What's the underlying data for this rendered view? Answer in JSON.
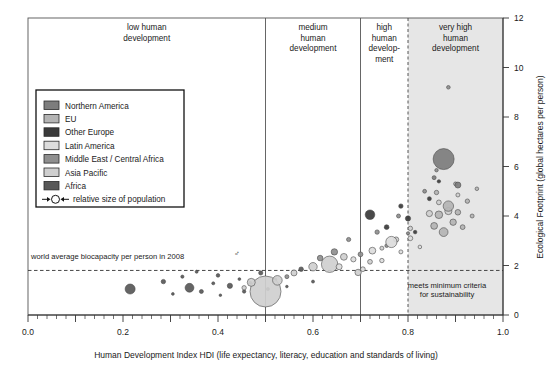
{
  "chart_data": {
    "type": "scatter",
    "title": "",
    "xlabel": "Human Development Index HDI (life expectancy, literacy, education and standards of living)",
    "ylabel": "Ecological Footprint (global hectares per person)",
    "xlim": [
      0.0,
      1.0
    ],
    "ylim": [
      0,
      12
    ],
    "xticks": [
      "0.0",
      "0.2",
      "0.4",
      "0.6",
      "0.8",
      "1.0"
    ],
    "xtick_values": [
      0.0,
      0.2,
      0.4,
      0.6,
      0.8,
      1.0
    ],
    "yticks": [
      "0",
      "2",
      "4",
      "6",
      "8",
      "10",
      "12"
    ],
    "ytick_values": [
      0,
      2,
      4,
      6,
      8,
      10,
      12
    ],
    "grid": false,
    "bubble_size_meaning": "relative size of population",
    "bands": [
      {
        "label": "low human development",
        "x_start": 0.0,
        "x_end": 0.5,
        "divider": "solid"
      },
      {
        "label": "medium human development",
        "x_start": 0.5,
        "x_end": 0.7,
        "divider": "solid"
      },
      {
        "label": "high human develop- ment",
        "x_start": 0.7,
        "x_end": 0.8,
        "divider": "solid"
      },
      {
        "label": "very high human development",
        "x_start": 0.8,
        "x_end": 1.0,
        "divider": "dashed",
        "shaded": true
      }
    ],
    "reference_lines": [
      {
        "label": "world average biocapacity per person in 2008",
        "orientation": "horizontal",
        "value": 1.8,
        "style": "dashed"
      },
      {
        "label": "meets minimum criteria for sustainability",
        "orientation": "vertical",
        "value": 0.8,
        "style": "dashed"
      }
    ],
    "annotations": [
      "world average biocapacity per person in 2008",
      "meets minimum criteria for sustainability"
    ],
    "legend": {
      "position": "upper-left inside plot",
      "entries": [
        {
          "name": "Northern America",
          "color": "#7d7d7d"
        },
        {
          "name": "EU",
          "color": "#b4b4b4"
        },
        {
          "name": "Other Europe",
          "color": "#3a3a3a"
        },
        {
          "name": "Latin America",
          "color": "#dcdcdc"
        },
        {
          "name": "Middle East / Central Africa",
          "color": "#8f8f8f"
        },
        {
          "name": "Asia Pacific",
          "color": "#cfcfcf"
        },
        {
          "name": "Africa",
          "color": "#585858"
        }
      ],
      "size_key_label": "relative size of population"
    },
    "series": [
      {
        "name": "Africa",
        "color": "#585858",
        "points": [
          {
            "x": 0.215,
            "y": 1.05,
            "r": 5.0
          },
          {
            "x": 0.285,
            "y": 1.35,
            "r": 2.2
          },
          {
            "x": 0.305,
            "y": 0.85,
            "r": 1.4
          },
          {
            "x": 0.325,
            "y": 1.55,
            "r": 1.6
          },
          {
            "x": 0.34,
            "y": 1.1,
            "r": 4.4
          },
          {
            "x": 0.355,
            "y": 1.75,
            "r": 1.5
          },
          {
            "x": 0.365,
            "y": 0.95,
            "r": 2.0
          },
          {
            "x": 0.39,
            "y": 1.28,
            "r": 1.5
          },
          {
            "x": 0.4,
            "y": 1.6,
            "r": 1.8
          },
          {
            "x": 0.405,
            "y": 0.8,
            "r": 1.3
          },
          {
            "x": 0.425,
            "y": 1.18,
            "r": 2.6
          },
          {
            "x": 0.445,
            "y": 1.45,
            "r": 1.4
          },
          {
            "x": 0.455,
            "y": 0.95,
            "r": 1.7
          },
          {
            "x": 0.468,
            "y": 1.3,
            "r": 1.5
          },
          {
            "x": 0.49,
            "y": 1.7,
            "r": 2.1
          },
          {
            "x": 0.505,
            "y": 1.05,
            "r": 1.6
          },
          {
            "x": 0.52,
            "y": 1.42,
            "r": 1.9
          },
          {
            "x": 0.545,
            "y": 1.15,
            "r": 1.3
          },
          {
            "x": 0.575,
            "y": 1.85,
            "r": 2.3
          },
          {
            "x": 0.6,
            "y": 1.35,
            "r": 1.5
          }
        ]
      },
      {
        "name": "Asia Pacific",
        "color": "#cfcfcf",
        "points": [
          {
            "x": 0.5,
            "y": 0.95,
            "r": 15.5
          },
          {
            "x": 0.47,
            "y": 1.32,
            "r": 4.0
          },
          {
            "x": 0.455,
            "y": 1.1,
            "r": 2.2
          },
          {
            "x": 0.525,
            "y": 1.4,
            "r": 4.8
          },
          {
            "x": 0.56,
            "y": 1.7,
            "r": 3.0
          },
          {
            "x": 0.6,
            "y": 1.95,
            "r": 4.2
          },
          {
            "x": 0.635,
            "y": 2.05,
            "r": 8.2
          },
          {
            "x": 0.665,
            "y": 2.35,
            "r": 3.4
          },
          {
            "x": 0.695,
            "y": 1.72,
            "r": 3.2
          },
          {
            "x": 0.72,
            "y": 2.15,
            "r": 2.4
          },
          {
            "x": 0.745,
            "y": 2.7,
            "r": 2.0
          },
          {
            "x": 0.775,
            "y": 3.05,
            "r": 2.6
          },
          {
            "x": 0.805,
            "y": 3.5,
            "r": 2.2
          },
          {
            "x": 0.845,
            "y": 4.1,
            "r": 3.1
          },
          {
            "x": 0.865,
            "y": 4.55,
            "r": 2.4
          },
          {
            "x": 0.885,
            "y": 4.2,
            "r": 3.6
          },
          {
            "x": 0.905,
            "y": 4.85,
            "r": 2.0
          }
        ]
      },
      {
        "name": "Middle East / Central Africa",
        "color": "#8f8f8f",
        "points": [
          {
            "x": 0.545,
            "y": 1.55,
            "r": 2.0
          },
          {
            "x": 0.615,
            "y": 2.3,
            "r": 2.8
          },
          {
            "x": 0.645,
            "y": 2.55,
            "r": 3.2
          },
          {
            "x": 0.675,
            "y": 3.05,
            "r": 2.1
          },
          {
            "x": 0.7,
            "y": 2.45,
            "r": 2.4
          },
          {
            "x": 0.735,
            "y": 3.35,
            "r": 2.2
          },
          {
            "x": 0.755,
            "y": 2.8,
            "r": 1.8
          },
          {
            "x": 0.78,
            "y": 4.0,
            "r": 2.0
          },
          {
            "x": 0.8,
            "y": 3.3,
            "r": 1.6
          },
          {
            "x": 0.835,
            "y": 5.0,
            "r": 1.9
          },
          {
            "x": 0.86,
            "y": 5.85,
            "r": 1.7
          },
          {
            "x": 0.885,
            "y": 9.2,
            "r": 1.8
          }
        ]
      },
      {
        "name": "Latin America",
        "color": "#dcdcdc",
        "points": [
          {
            "x": 0.655,
            "y": 1.95,
            "r": 3.0
          },
          {
            "x": 0.685,
            "y": 2.25,
            "r": 2.6
          },
          {
            "x": 0.705,
            "y": 1.85,
            "r": 2.4
          },
          {
            "x": 0.725,
            "y": 2.6,
            "r": 3.4
          },
          {
            "x": 0.745,
            "y": 2.2,
            "r": 2.2
          },
          {
            "x": 0.765,
            "y": 2.95,
            "r": 5.6
          },
          {
            "x": 0.785,
            "y": 2.55,
            "r": 2.0
          },
          {
            "x": 0.805,
            "y": 3.1,
            "r": 2.4
          },
          {
            "x": 0.825,
            "y": 2.75,
            "r": 1.8
          }
        ]
      },
      {
        "name": "Other Europe",
        "color": "#3a3a3a",
        "points": [
          {
            "x": 0.72,
            "y": 4.05,
            "r": 4.8
          },
          {
            "x": 0.755,
            "y": 3.55,
            "r": 2.4
          },
          {
            "x": 0.785,
            "y": 4.4,
            "r": 2.2
          },
          {
            "x": 0.8,
            "y": 3.9,
            "r": 2.6
          },
          {
            "x": 0.815,
            "y": 3.35,
            "r": 1.8
          },
          {
            "x": 0.845,
            "y": 4.7,
            "r": 2.0
          },
          {
            "x": 0.865,
            "y": 5.4,
            "r": 1.7
          }
        ]
      },
      {
        "name": "EU",
        "color": "#b4b4b4",
        "points": [
          {
            "x": 0.855,
            "y": 3.6,
            "r": 3.4
          },
          {
            "x": 0.865,
            "y": 4.05,
            "r": 3.8
          },
          {
            "x": 0.875,
            "y": 3.35,
            "r": 4.4
          },
          {
            "x": 0.885,
            "y": 4.4,
            "r": 5.2
          },
          {
            "x": 0.895,
            "y": 3.75,
            "r": 3.2
          },
          {
            "x": 0.905,
            "y": 4.15,
            "r": 2.8
          },
          {
            "x": 0.915,
            "y": 3.55,
            "r": 2.4
          },
          {
            "x": 0.925,
            "y": 4.6,
            "r": 2.2
          },
          {
            "x": 0.935,
            "y": 4.0,
            "r": 2.0
          },
          {
            "x": 0.945,
            "y": 5.1,
            "r": 1.8
          },
          {
            "x": 0.86,
            "y": 4.95,
            "r": 2.2
          },
          {
            "x": 0.9,
            "y": 5.3,
            "r": 1.9
          }
        ]
      },
      {
        "name": "Northern America",
        "color": "#7d7d7d",
        "points": [
          {
            "x": 0.875,
            "y": 6.3,
            "r": 10.5
          },
          {
            "x": 0.905,
            "y": 5.25,
            "r": 3.0
          },
          {
            "x": 0.855,
            "y": 5.55,
            "r": 2.0
          }
        ]
      }
    ]
  }
}
